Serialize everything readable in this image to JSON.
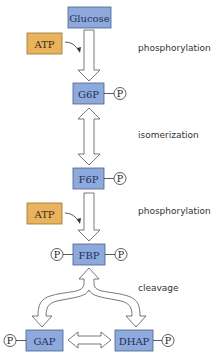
{
  "diagram": {
    "colors": {
      "molecule_fill": "#8ea9db",
      "molecule_border": "#4a5f8a",
      "atp_fill": "#e9b35d",
      "atp_border": "#9a7430",
      "arrow_fill": "#ffffff",
      "arrow_stroke": "#555555"
    },
    "molecules": {
      "glucose": "Glucose",
      "g6p": "G6P",
      "f6p": "F6P",
      "fbp": "FBP",
      "gap": "GAP",
      "dhap": "DHAP"
    },
    "cofactors": {
      "atp1": "ATP",
      "atp2": "ATP"
    },
    "phosphate_label": "P",
    "steps": {
      "step1": "phosphorylation",
      "step2": "isomerization",
      "step3": "phosphorylation",
      "step4": "cleavage"
    }
  }
}
